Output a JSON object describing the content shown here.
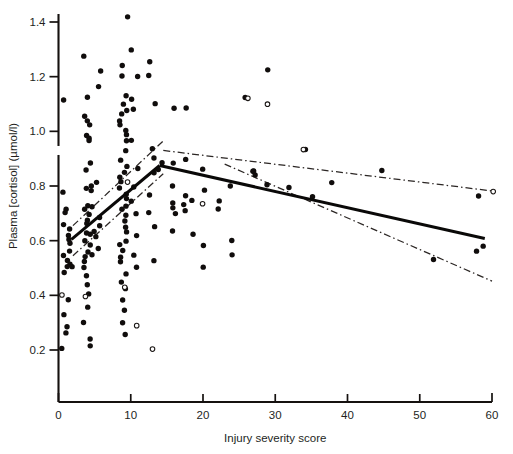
{
  "chart_data": {
    "type": "scatter",
    "title": "",
    "subtitle": "",
    "xlabel": "Injury severity score",
    "ylabel": "Plasma [cortisol] (µmol/l)",
    "xlim": [
      0,
      60
    ],
    "ylim": [
      0.1,
      1.45
    ],
    "xticks": [
      0,
      10,
      20,
      30,
      40,
      50,
      60
    ],
    "xticklabels": [
      "0",
      "10",
      "20",
      "30",
      "40",
      "50",
      "60"
    ],
    "yticks": [
      0.2,
      0.4,
      0.6,
      0.8,
      1.0,
      1.2,
      1.4
    ],
    "yticklabels": [
      "0.2",
      "0.4",
      "0.6",
      "0.8",
      "1.0",
      "1.2",
      "1.4"
    ],
    "grid": false,
    "legend": null,
    "axis_break": {
      "axis": "y",
      "value": 0.93,
      "note": "small break mark on y-axis"
    },
    "annotations": [],
    "series": [
      {
        "name": "Patients (filled circles)",
        "marker": "filled-circle",
        "points": [
          [
            1.0,
            1.12
          ],
          [
            1.0,
            0.78
          ],
          [
            1.0,
            0.72
          ],
          [
            1.0,
            0.7
          ],
          [
            1.0,
            0.66
          ],
          [
            1.0,
            0.64
          ],
          [
            1.0,
            0.62
          ],
          [
            1.0,
            0.6
          ],
          [
            1.0,
            0.56
          ],
          [
            1.0,
            0.54
          ],
          [
            1.0,
            0.53
          ],
          [
            1.0,
            0.5
          ],
          [
            1.0,
            0.48
          ],
          [
            1.0,
            0.38
          ],
          [
            1.0,
            0.33
          ],
          [
            1.0,
            0.28
          ],
          [
            1.0,
            0.26
          ],
          [
            1.0,
            0.2
          ],
          [
            1.6,
            0.59
          ],
          [
            1.6,
            0.52
          ],
          [
            1.6,
            0.5
          ],
          [
            4.0,
            1.27
          ],
          [
            4.0,
            1.12
          ],
          [
            4.0,
            1.06
          ],
          [
            4.0,
            1.04
          ],
          [
            4.0,
            1.02
          ],
          [
            4.0,
            0.99
          ],
          [
            4.0,
            0.98
          ],
          [
            4.0,
            0.97
          ],
          [
            4.0,
            0.88
          ],
          [
            4.0,
            0.86
          ],
          [
            4.0,
            0.8
          ],
          [
            4.0,
            0.79
          ],
          [
            4.0,
            0.78
          ],
          [
            4.0,
            0.73
          ],
          [
            4.0,
            0.71
          ],
          [
            4.0,
            0.7
          ],
          [
            4.0,
            0.68
          ],
          [
            4.0,
            0.66
          ],
          [
            4.0,
            0.63
          ],
          [
            4.0,
            0.62
          ],
          [
            4.0,
            0.6
          ],
          [
            4.0,
            0.58
          ],
          [
            4.0,
            0.56
          ],
          [
            4.0,
            0.54
          ],
          [
            4.0,
            0.52
          ],
          [
            4.0,
            0.5
          ],
          [
            4.0,
            0.47
          ],
          [
            4.0,
            0.44
          ],
          [
            4.0,
            0.4
          ],
          [
            4.0,
            0.36
          ],
          [
            4.0,
            0.3
          ],
          [
            4.0,
            0.24
          ],
          [
            4.0,
            0.22
          ],
          [
            5.2,
            1.16
          ],
          [
            5.2,
            0.81
          ],
          [
            5.2,
            0.73
          ],
          [
            5.2,
            0.68
          ],
          [
            5.2,
            0.65
          ],
          [
            5.2,
            0.63
          ],
          [
            5.2,
            0.61
          ],
          [
            5.2,
            0.57
          ],
          [
            5.2,
            0.55
          ],
          [
            6.2,
            1.22
          ],
          [
            9.0,
            1.42
          ],
          [
            9.0,
            1.24
          ],
          [
            9.0,
            1.2
          ],
          [
            9.0,
            1.13
          ],
          [
            9.0,
            1.1
          ],
          [
            9.0,
            1.08
          ],
          [
            9.0,
            1.06
          ],
          [
            9.0,
            1.04
          ],
          [
            9.0,
            1.02
          ],
          [
            9.0,
            1.0
          ],
          [
            9.0,
            0.99
          ],
          [
            9.0,
            0.97
          ],
          [
            9.0,
            0.93
          ],
          [
            9.0,
            0.9
          ],
          [
            9.0,
            0.87
          ],
          [
            9.0,
            0.85
          ],
          [
            9.0,
            0.83
          ],
          [
            9.0,
            0.81
          ],
          [
            9.0,
            0.79
          ],
          [
            9.0,
            0.77
          ],
          [
            9.0,
            0.75
          ],
          [
            9.0,
            0.73
          ],
          [
            9.0,
            0.71
          ],
          [
            9.0,
            0.69
          ],
          [
            9.0,
            0.67
          ],
          [
            9.0,
            0.65
          ],
          [
            9.0,
            0.63
          ],
          [
            9.0,
            0.6
          ],
          [
            9.0,
            0.58
          ],
          [
            9.0,
            0.56
          ],
          [
            9.0,
            0.54
          ],
          [
            9.0,
            0.52
          ],
          [
            9.0,
            0.48
          ],
          [
            9.0,
            0.45
          ],
          [
            9.0,
            0.42
          ],
          [
            9.0,
            0.38
          ],
          [
            9.0,
            0.34
          ],
          [
            9.0,
            0.3
          ],
          [
            9.0,
            0.26
          ],
          [
            10.5,
            1.3
          ],
          [
            10.5,
            1.2
          ],
          [
            10.5,
            1.12
          ],
          [
            10.5,
            1.08
          ],
          [
            10.5,
            0.97
          ],
          [
            10.5,
            0.86
          ],
          [
            10.5,
            0.8
          ],
          [
            10.5,
            0.75
          ],
          [
            10.5,
            0.7
          ],
          [
            10.5,
            0.62
          ],
          [
            10.5,
            0.55
          ],
          [
            10.5,
            0.5
          ],
          [
            13.0,
            1.25
          ],
          [
            13.0,
            1.2
          ],
          [
            13.0,
            1.1
          ],
          [
            13.0,
            0.94
          ],
          [
            13.0,
            0.9
          ],
          [
            13.0,
            0.85
          ],
          [
            13.0,
            0.77
          ],
          [
            13.0,
            0.7
          ],
          [
            13.0,
            0.65
          ],
          [
            13.0,
            0.53
          ],
          [
            14.0,
            0.88
          ],
          [
            14.0,
            0.86
          ],
          [
            16.0,
            1.09
          ],
          [
            16.0,
            0.88
          ],
          [
            16.0,
            0.8
          ],
          [
            16.0,
            0.74
          ],
          [
            16.0,
            0.72
          ],
          [
            16.0,
            0.7
          ],
          [
            16.0,
            0.64
          ],
          [
            17.5,
            1.09
          ],
          [
            17.5,
            0.9
          ],
          [
            17.5,
            0.76
          ],
          [
            17.5,
            0.73
          ],
          [
            17.5,
            0.71
          ],
          [
            18.5,
            0.75
          ],
          [
            18.5,
            0.62
          ],
          [
            20.0,
            0.86
          ],
          [
            20.0,
            0.79
          ],
          [
            20.0,
            0.58
          ],
          [
            20.0,
            0.5
          ],
          [
            22.0,
            0.74
          ],
          [
            22.0,
            0.72
          ],
          [
            24.0,
            0.8
          ],
          [
            24.0,
            0.6
          ],
          [
            24.0,
            0.55
          ],
          [
            26.0,
            1.12
          ],
          [
            27.0,
            0.86
          ],
          [
            27.0,
            0.85
          ],
          [
            27.0,
            0.84
          ],
          [
            29.0,
            1.22
          ],
          [
            29.0,
            0.81
          ],
          [
            32.0,
            0.79
          ],
          [
            34.0,
            0.93
          ],
          [
            35.0,
            0.76
          ],
          [
            38.0,
            0.81
          ],
          [
            45.0,
            0.86
          ],
          [
            52.0,
            0.53
          ],
          [
            58.0,
            0.76
          ],
          [
            58.0,
            0.56
          ],
          [
            59.0,
            0.58
          ]
        ]
      },
      {
        "name": "Patients (open circles)",
        "marker": "open-circle",
        "points": [
          [
            1.0,
            0.4
          ],
          [
            4.0,
            0.39
          ],
          [
            9.0,
            0.43
          ],
          [
            9.0,
            0.82
          ],
          [
            10.5,
            0.29
          ],
          [
            13.0,
            0.2
          ],
          [
            20.0,
            0.74
          ],
          [
            26.0,
            1.12
          ],
          [
            29.0,
            1.1
          ],
          [
            34.0,
            0.93
          ],
          [
            60.0,
            0.78
          ]
        ]
      }
    ],
    "fit_lines": [
      {
        "name": "regression-low-iss",
        "style": "solid",
        "x": [
          1.8,
          14.0
        ],
        "y": [
          0.605,
          0.875
        ]
      },
      {
        "name": "regression-high-iss",
        "style": "solid",
        "x": [
          14.0,
          59.0
        ],
        "y": [
          0.875,
          0.608
        ]
      }
    ],
    "confidence_bands": [
      {
        "name": "ci-upper-low-iss",
        "style": "dash-dot",
        "x": [
          2.0,
          14.5
        ],
        "y": [
          0.655,
          0.965
        ]
      },
      {
        "name": "ci-lower-low-iss",
        "style": "dash-dot",
        "x": [
          2.0,
          14.5
        ],
        "y": [
          0.545,
          0.845
        ]
      },
      {
        "name": "ci-upper-high-iss",
        "style": "dash-dot",
        "x": [
          14.5,
          60.0
        ],
        "y": [
          0.93,
          0.782
        ]
      },
      {
        "name": "ci-lower-high-iss",
        "style": "dash-dot",
        "x": [
          23.0,
          60.0
        ],
        "y": [
          0.88,
          0.452
        ]
      }
    ]
  },
  "figure": {
    "background_color": "#ffffff",
    "ink_color": "#15110f",
    "marker_color": "#100d0c"
  }
}
